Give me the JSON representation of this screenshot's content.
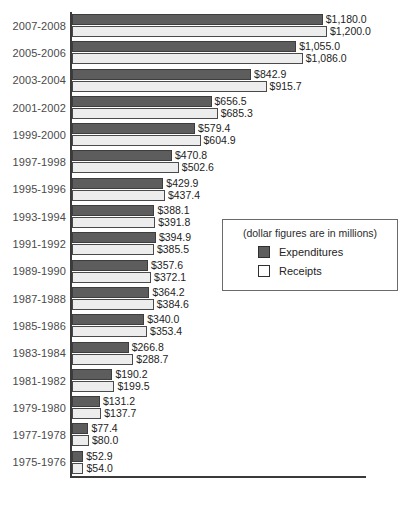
{
  "chart_data": {
    "type": "bar",
    "orientation": "horizontal",
    "title": "",
    "xlabel": "",
    "ylabel": "",
    "grid": false,
    "xlim": [
      0,
      1200
    ],
    "legend_position": "center-right",
    "legend_title": "(dollar figures are in millions)",
    "categories": [
      "2007-2008",
      "2005-2006",
      "2003-2004",
      "2001-2002",
      "1999-2000",
      "1997-1998",
      "1995-1996",
      "1993-1994",
      "1991-1992",
      "1989-1990",
      "1987-1988",
      "1985-1986",
      "1983-1984",
      "1981-1982",
      "1979-1980",
      "1977-1978",
      "1975-1976"
    ],
    "series": [
      {
        "name": "Expenditures",
        "color": "#5d5d5d",
        "values": [
          1180.0,
          1055.0,
          842.9,
          656.5,
          579.4,
          470.8,
          429.9,
          388.1,
          394.9,
          357.6,
          364.2,
          340.0,
          266.8,
          190.2,
          131.2,
          77.4,
          52.9
        ],
        "labels": [
          "$1,180.0",
          "$1,055.0",
          "$842.9",
          "$656.5",
          "$579.4",
          "$470.8",
          "$429.9",
          "$388.1",
          "$394.9",
          "$357.6",
          "$364.2",
          "$340.0",
          "$266.8",
          "$190.2",
          "$131.2",
          "$77.4",
          "$52.9"
        ]
      },
      {
        "name": "Receipts",
        "color": "#ededed",
        "values": [
          1200.0,
          1086.0,
          915.7,
          685.3,
          604.9,
          502.6,
          437.4,
          391.8,
          385.5,
          372.1,
          384.6,
          353.4,
          288.7,
          199.5,
          137.7,
          80.0,
          54.0
        ],
        "labels": [
          "$1,200.0",
          "$1,086.0",
          "$915.7",
          "$685.3",
          "$604.9",
          "$502.6",
          "$437.4",
          "$391.8",
          "$385.5",
          "$372.1",
          "$384.6",
          "$353.4",
          "$288.7",
          "$199.5",
          "$137.7",
          "$80.0",
          "$54.0"
        ]
      }
    ]
  },
  "legend": {
    "note": "(dollar figures are in millions)",
    "items": [
      {
        "label": "Expenditures",
        "swatch": "expend"
      },
      {
        "label": "Receipts",
        "swatch": "receipt"
      }
    ]
  }
}
